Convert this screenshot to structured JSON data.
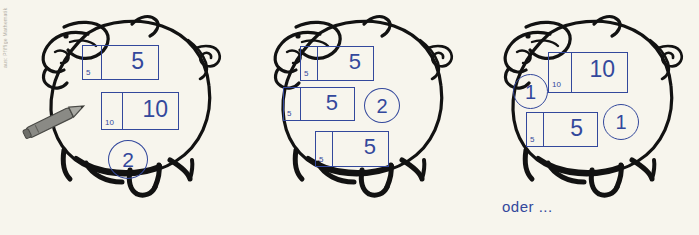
{
  "page": {
    "background_color": "#f7f5ed",
    "ink_color": "#33489c",
    "outline_color": "#121212",
    "edge_strip_text": "aus: Pfiffige Mathematik"
  },
  "caption": {
    "oder_label": "oder ..."
  },
  "pigs": [
    {
      "name": "pig-left",
      "boxes": [
        {
          "small_label": "5",
          "big_label": "5"
        },
        {
          "small_label": "10",
          "big_label": "10"
        }
      ],
      "circles": [
        {
          "label": "2"
        }
      ],
      "pencil": {
        "present": true,
        "color": "#7b7b77"
      }
    },
    {
      "name": "pig-middle",
      "boxes": [
        {
          "small_label": "5",
          "big_label": "5"
        },
        {
          "small_label": "5",
          "big_label": "5"
        },
        {
          "small_label": "5",
          "big_label": "5"
        }
      ],
      "circles": [
        {
          "label": "2"
        }
      ],
      "pencil": {
        "present": false
      }
    },
    {
      "name": "pig-right",
      "boxes": [
        {
          "small_label": "10",
          "big_label": "10"
        },
        {
          "small_label": "5",
          "big_label": "5"
        }
      ],
      "circles": [
        {
          "label": "1"
        },
        {
          "label": "1"
        }
      ],
      "pencil": {
        "present": false
      }
    }
  ]
}
